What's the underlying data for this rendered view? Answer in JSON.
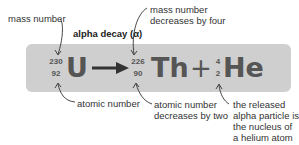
{
  "title": "alpha decay (α)",
  "annotations": {
    "mass_number": "mass number",
    "mass_decrease_line1": "mass number",
    "mass_decrease_line2": "decreases by four",
    "atomic_number": "atomic number",
    "atomic_decrease_line1": "atomic number",
    "atomic_decrease_line2": "decreases by two",
    "alpha_line1": "the released",
    "alpha_line2": "alpha particle is",
    "alpha_line3": "the nucleus of",
    "alpha_line4": "a helium atom"
  },
  "equation": {
    "parent": {
      "mass": "230",
      "atomic": "92",
      "symbol": "U"
    },
    "daughter": {
      "mass": "226",
      "atomic": "90",
      "symbol": "Th"
    },
    "plus": "+",
    "particle": {
      "mass": "4",
      "atomic": "2",
      "symbol": "He"
    }
  },
  "colors": {
    "box": "#cfcfcf",
    "equation_text": "#555555",
    "label_text": "#333333"
  }
}
